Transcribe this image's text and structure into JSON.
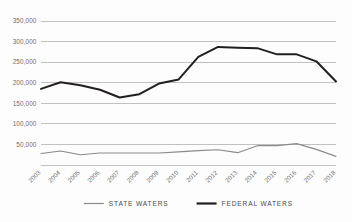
{
  "chart_data": {
    "type": "line",
    "title": "",
    "subtitle": "",
    "xlabel": "",
    "ylabel": "",
    "grid": true,
    "legend_position": "bottom",
    "ylim": [
      0,
      350000
    ],
    "ytick_values": [
      350000,
      300000,
      250000,
      200000,
      150000,
      100000,
      50000,
      0
    ],
    "ytick_labels": [
      "350,000",
      "300,000",
      "250,000",
      "200,000",
      "150,000",
      "100,000",
      "50,000",
      ""
    ],
    "categories": [
      "2003",
      "2004",
      "2005",
      "2006",
      "2007",
      "2008",
      "2009",
      "2010",
      "2011",
      "2012",
      "2013",
      "2014",
      "2015",
      "2016",
      "2017",
      "2018"
    ],
    "series": [
      {
        "name": "STATE WATERS",
        "color": "#8a8a8a",
        "width": 1.1,
        "values": [
          28000,
          34000,
          25000,
          29000,
          29000,
          29000,
          29000,
          32000,
          35000,
          37000,
          30000,
          47000,
          47000,
          52000,
          38000,
          21000
        ]
      },
      {
        "name": "FEDERAL WATERS",
        "color": "#231f20",
        "width": 2.0,
        "values": [
          185000,
          201000,
          194000,
          183000,
          164000,
          172000,
          198000,
          208000,
          263000,
          287000,
          285000,
          284000,
          269000,
          269000,
          252000,
          203000
        ]
      }
    ]
  },
  "legend": {
    "items": [
      {
        "label": "STATE WATERS",
        "color": "#8a8a8a",
        "width": 1.2
      },
      {
        "label": "FEDERAL WATERS",
        "color": "#231f20",
        "width": 2.2
      }
    ]
  }
}
